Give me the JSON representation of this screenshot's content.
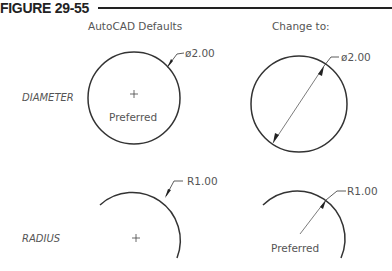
{
  "figure": {
    "title": "FIGURE 29-55",
    "columns": [
      "AutoCAD Defaults",
      "Change to:"
    ],
    "rows": [
      "DIAMETER",
      "RADIUS"
    ],
    "cells": {
      "diameter_default": {
        "dimension": "ø2.00",
        "note": "Preferred"
      },
      "diameter_change": {
        "dimension": "ø2.00"
      },
      "radius_default": {
        "dimension": "R1.00"
      },
      "radius_change": {
        "dimension": "R1.00",
        "note": "Preferred"
      }
    }
  }
}
